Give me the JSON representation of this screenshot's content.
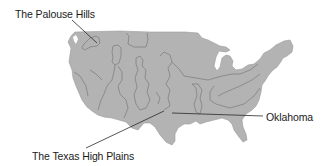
{
  "figure": {
    "colors": {
      "land_fill": "#b3b3b3",
      "region_border": "#8a8a8a",
      "leader_line": "#2a2a2a",
      "label_text": "#1a1a1a",
      "background": "#ffffff"
    }
  },
  "callouts": [
    {
      "id": "palouse",
      "label": "The Palouse Hills"
    },
    {
      "id": "oklahoma",
      "label": "Oklahoma"
    },
    {
      "id": "texas",
      "label": "The Texas High Plains"
    }
  ]
}
